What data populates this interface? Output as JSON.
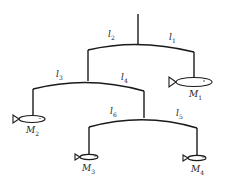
{
  "diagram": {
    "arm_labels": {
      "l1": {
        "symbol": "l",
        "index": "1"
      },
      "l2": {
        "symbol": "l",
        "index": "2"
      },
      "l3": {
        "symbol": "l",
        "index": "3"
      },
      "l4": {
        "symbol": "l",
        "index": "4"
      },
      "l5": {
        "symbol": "l",
        "index": "5"
      },
      "l6": {
        "symbol": "l",
        "index": "6"
      }
    },
    "mass_labels": {
      "M1": {
        "symbol": "M",
        "index": "1"
      },
      "M2": {
        "symbol": "M",
        "index": "2"
      },
      "M3": {
        "symbol": "M",
        "index": "3"
      },
      "M4": {
        "symbol": "M",
        "index": "4"
      }
    },
    "line_color": "#1a1a1a"
  }
}
